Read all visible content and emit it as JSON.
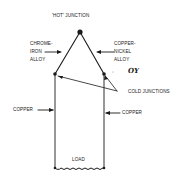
{
  "diagram": {
    "type": "thermocouple-circuit",
    "labels": {
      "hot_junction": "'HOT' JUNCTION",
      "left_alloy": [
        "CHROME-",
        "IRON",
        "ALLOY"
      ],
      "right_alloy": [
        "COPPER-",
        "NICKEL",
        "ALLOY"
      ],
      "cold_junctions": "COLD JUNCTIONS",
      "left_wire": "COPPER",
      "right_wire": "COPPER",
      "load": "LOAD",
      "annotation": "OY"
    },
    "colors": {
      "line": "#1a1a1a",
      "background": "#ffffff"
    }
  }
}
